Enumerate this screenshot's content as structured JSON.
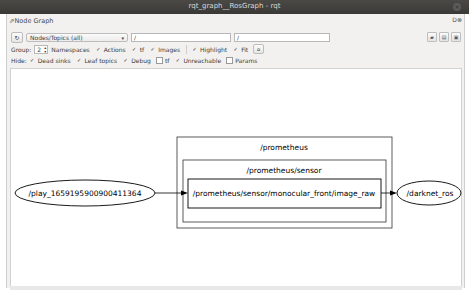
{
  "window": {
    "title": "rqt_graph__RosGraph - rqt",
    "close_icon": "close-icon"
  },
  "dock": {
    "title": "Node Graph",
    "buttons": "D ⓿"
  },
  "toolbar": {
    "refresh_icon": "refresh-icon",
    "mode_select": "Nodes/Topics (all)",
    "node_filter": "/",
    "topic_filter": "/",
    "group_label": "Group:",
    "group_value": "2",
    "options": [
      {
        "label": "Namespaces",
        "checked": true
      },
      {
        "label": "Actions",
        "checked": true
      },
      {
        "label": "tf",
        "checked": true
      },
      {
        "label": "Images",
        "checked": true
      },
      {
        "label": "Highlight",
        "checked": true
      },
      {
        "label": "Fit",
        "checked": true
      }
    ],
    "fit_button_icon": "fit-view-icon",
    "hide_label": "Hide:",
    "hide_options": [
      {
        "label": "Dead sinks",
        "checked": true
      },
      {
        "label": "Leaf topics",
        "checked": true
      },
      {
        "label": "Debug",
        "checked": true
      },
      {
        "label": "tf",
        "checked": false
      },
      {
        "label": "Unreachable",
        "checked": true
      },
      {
        "label": "Params",
        "checked": false
      }
    ],
    "right_buttons": [
      "load-dot-icon",
      "save-dot-icon",
      "save-image-icon"
    ]
  },
  "graph": {
    "clusters": [
      {
        "label": "/prometheus"
      },
      {
        "label": "/prometheus/sensor"
      }
    ],
    "topic": "/prometheus/sensor/monocular_front/image_raw",
    "nodes": [
      {
        "label": "/play_1659195900900411364"
      },
      {
        "label": "/darknet_ros"
      }
    ]
  }
}
